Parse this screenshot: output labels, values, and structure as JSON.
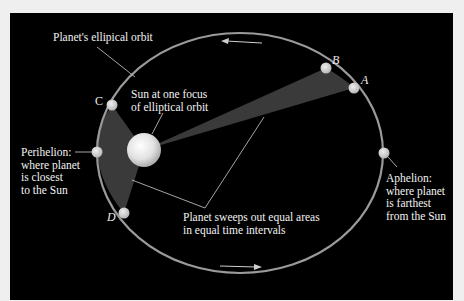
{
  "diagram": {
    "labels": {
      "orbit": "Planet's ellipical orbit",
      "sun": "Sun at one focus\nof elliptical orbit",
      "perihelion": "Perihelion:\nwhere planet\nis closest\nto the Sun",
      "aphelion": "Aphelion:\nwhere planet\nis farthest\nfrom the Sun",
      "equal_areas": "Planet sweeps out equal areas\nin equal time intervals"
    },
    "points": {
      "A": "A",
      "B": "B",
      "C": "C",
      "D": "D"
    },
    "icons": {
      "top_arrow": "arrow-left-icon",
      "bottom_arrow": "arrow-right-icon"
    },
    "colors": {
      "background": "#000000",
      "orbit": "#9a9a9a",
      "swept_area": "#3a3a3a",
      "planet": "#cfcfcf",
      "sun": "#e8e8e8",
      "text": "#f2f2f2",
      "page": "#efefef"
    }
  }
}
